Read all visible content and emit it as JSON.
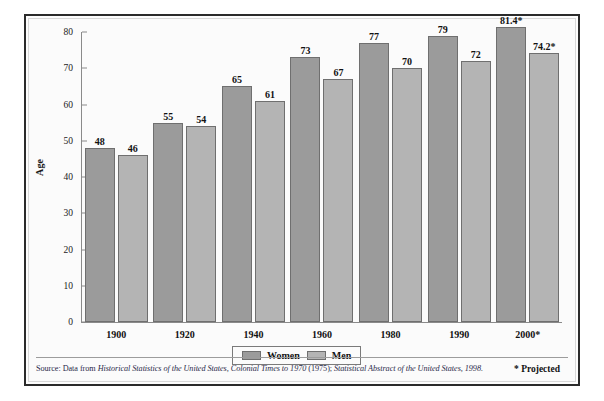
{
  "chart_data": {
    "type": "bar",
    "title": "",
    "xlabel": "",
    "ylabel": "Age",
    "ylim": [
      0,
      80
    ],
    "yticks": [
      0,
      10,
      20,
      30,
      40,
      50,
      60,
      70,
      80
    ],
    "grid": false,
    "legend_position": "bottom-center",
    "categories": [
      "1900",
      "1920",
      "1940",
      "1960",
      "1980",
      "1990",
      "2000*"
    ],
    "series": [
      {
        "name": "Women",
        "color": "#9b9b9b",
        "values": [
          48,
          55,
          65,
          73,
          77,
          79,
          81.4
        ],
        "labels": [
          "48",
          "55",
          "65",
          "73",
          "77",
          "79",
          "81.4*"
        ]
      },
      {
        "name": "Men",
        "color": "#b4b4b4",
        "values": [
          46,
          54,
          61,
          67,
          70,
          72,
          74.2
        ],
        "labels": [
          "46",
          "54",
          "61",
          "67",
          "70",
          "72",
          "74.2*"
        ]
      }
    ],
    "annotations": [
      "* Projected"
    ],
    "source": "Source: Data from Historical Statistics of the United States, Colonial Times to 1970 (1975); Statistical Abstract of the United States, 1998."
  },
  "axis": {
    "y_label": "Age",
    "y_ticks": [
      "0",
      "10",
      "20",
      "30",
      "40",
      "50",
      "60",
      "70",
      "80"
    ],
    "x_ticks": [
      "1900",
      "1920",
      "1940",
      "1960",
      "1980",
      "1990",
      "2000*"
    ]
  },
  "legend": {
    "women_label": "Women",
    "men_label": "Men"
  },
  "notes": {
    "projected": "* Projected"
  },
  "source_note": {
    "prefix": "Source: Data from ",
    "title1": "Historical Statistics of the United States, Colonial Times to 1970",
    "mid": " (1975); ",
    "title2": "Statistical Abstract of the United States, 1998.",
    "full": "Source: Data from Historical Statistics of the United States, Colonial Times to 1970 (1975); Statistical Abstract of the United States, 1998."
  },
  "colors": {
    "women_bar": "#9b9b9b",
    "men_bar": "#b4b4b4",
    "frame": "#2b2b2b",
    "background": "#fbfbfb",
    "axis": "#8a8a8a"
  }
}
